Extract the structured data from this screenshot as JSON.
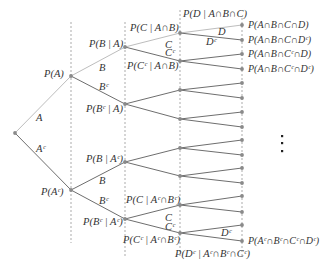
{
  "diagram": {
    "type": "probability-tree",
    "colors": {
      "branch_upper": "#bdbdbd",
      "branch": "#6e6e6e",
      "node": "#8a8a8a",
      "guide": "#888888",
      "text": "#333333"
    },
    "root": {
      "x": 15,
      "y": 133
    },
    "levels_x": [
      71,
      125,
      180,
      242
    ],
    "level1": [
      {
        "y": 76,
        "edge": "A",
        "prob": "P(A)"
      },
      {
        "y": 190,
        "edge": "Aᶜ",
        "prob": "P(Aᶜ)"
      }
    ],
    "level2": [
      {
        "y": 47,
        "edge": "B",
        "prob": "P(B | A)"
      },
      {
        "y": 104,
        "edge": "Bᶜ",
        "prob": "P(Bᶜ | A)"
      },
      {
        "y": 162,
        "edge": "B",
        "prob": "P(B | Aᶜ)"
      },
      {
        "y": 219,
        "edge": "Bᶜ",
        "prob": "P(Bᶜ | Aᶜ)"
      }
    ],
    "level3": [
      {
        "y": 33,
        "edge": "C",
        "prob": "P(C | A∩B)"
      },
      {
        "y": 61,
        "edge": "Cᶜ",
        "prob": "P(Cᶜ | A∩B)"
      },
      {
        "y": 90
      },
      {
        "y": 119
      },
      {
        "y": 148
      },
      {
        "y": 176
      },
      {
        "y": 205,
        "edge": "C",
        "prob": "P(C | Aᶜ∩Bᶜ)"
      },
      {
        "y": 233,
        "edge": "Cᶜ",
        "prob": "P(Cᶜ | Aᶜ∩Bᶜ)"
      }
    ],
    "level4_edges": {
      "top_D": "D",
      "top_Dc": "Dᶜ",
      "bottom_Dc": "Dᶜ",
      "top_prob": "P(D | A∩B∩C)",
      "bottom_prob": "P(Dᶜ | Aᶜ∩Bᶜ∩Cᶜ)"
    },
    "leaves": [
      {
        "y": 25,
        "label": "P(A∩B∩C∩D)"
      },
      {
        "y": 40,
        "label": "P(A∩B∩C∩Dᶜ)"
      },
      {
        "y": 54,
        "label": "P(A∩B∩Cᶜ∩D)"
      },
      {
        "y": 69,
        "label": "P(A∩B∩Cᶜ∩Dᶜ)"
      },
      {
        "y": 83,
        "label": ""
      },
      {
        "y": 98,
        "label": ""
      },
      {
        "y": 112,
        "label": ""
      },
      {
        "y": 127,
        "label": ""
      },
      {
        "y": 140,
        "label": ""
      },
      {
        "y": 155,
        "label": ""
      },
      {
        "y": 168,
        "label": ""
      },
      {
        "y": 183,
        "label": ""
      },
      {
        "y": 196,
        "label": ""
      },
      {
        "y": 212,
        "label": ""
      },
      {
        "y": 225,
        "label": ""
      },
      {
        "y": 241,
        "label": "P(Aᶜ∩Bᶜ∩Cᶜ∩Dᶜ)"
      }
    ],
    "ellipsis": "⋮"
  }
}
